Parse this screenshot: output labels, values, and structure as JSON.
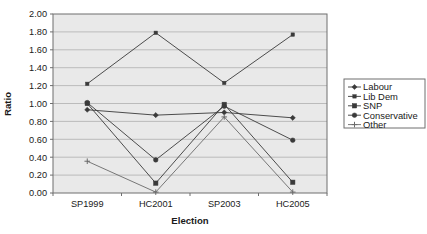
{
  "chart_data": {
    "type": "line",
    "title": "",
    "xlabel": "Election",
    "ylabel": "Ratio",
    "categories": [
      "SP1999",
      "HC2001",
      "SP2003",
      "HC2005"
    ],
    "ylim": [
      0.0,
      2.0
    ],
    "ytick_step": 0.2,
    "ytick_labels": [
      "0.00",
      "0.20",
      "0.40",
      "0.60",
      "0.80",
      "1.00",
      "1.20",
      "1.40",
      "1.60",
      "1.80",
      "2.00"
    ],
    "ytick_values": [
      0.0,
      0.2,
      0.4,
      0.6,
      0.8,
      1.0,
      1.2,
      1.4,
      1.6,
      1.8,
      2.0
    ],
    "grid": "horizontal",
    "legend_position": "right",
    "plot_background": "#e9e9e9",
    "series": [
      {
        "name": "Labour",
        "marker": "diamond",
        "color": "#3a3a3a",
        "values": [
          0.93,
          0.87,
          0.9,
          0.84
        ]
      },
      {
        "name": "Lib Dem",
        "marker": "square-small",
        "color": "#3a3a3a",
        "values": [
          1.22,
          1.79,
          1.23,
          1.77
        ]
      },
      {
        "name": "SNP",
        "marker": "square",
        "color": "#3a3a3a",
        "values": [
          1.0,
          0.11,
          0.99,
          0.12
        ]
      },
      {
        "name": "Conservative",
        "marker": "circle",
        "color": "#3a3a3a",
        "values": [
          1.01,
          0.37,
          0.97,
          0.59
        ]
      },
      {
        "name": "Other",
        "marker": "plus",
        "color": "#6a6a6a",
        "values": [
          0.355,
          0.01,
          0.85,
          0.01
        ]
      }
    ]
  },
  "axis": {
    "x_title": "Election",
    "y_title": "Ratio"
  },
  "legend": {
    "entries": [
      {
        "label": "Labour"
      },
      {
        "label": "Lib Dem"
      },
      {
        "label": "SNP"
      },
      {
        "label": "Conservative"
      },
      {
        "label": "Other"
      }
    ]
  },
  "caption": {
    "text": ""
  }
}
